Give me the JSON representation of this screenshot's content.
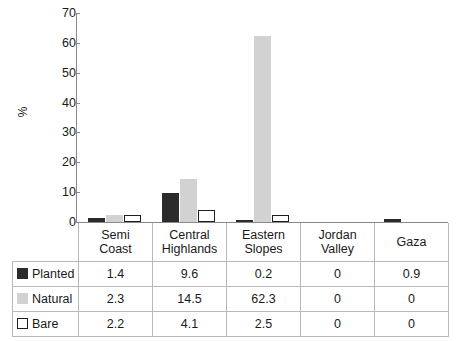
{
  "chart_data": {
    "type": "bar",
    "title": "",
    "subtitle": "",
    "xlabel": "",
    "ylabel": "%",
    "ylim": [
      0,
      70
    ],
    "yticks": [
      0,
      10,
      20,
      30,
      40,
      50,
      60,
      70
    ],
    "grid": false,
    "legend_position": "table-row-labels",
    "categories": [
      "Semi Coast",
      "Central Highlands",
      "Eastern Slopes",
      "Jordan Valley",
      "Gaza"
    ],
    "category_lines": [
      [
        "Semi",
        "Coast"
      ],
      [
        "Central",
        "Highlands"
      ],
      [
        "Eastern",
        "Slopes"
      ],
      [
        "Jordan",
        "Valley"
      ],
      [
        "Gaza",
        ""
      ]
    ],
    "series": [
      {
        "name": "Planted",
        "color": "#2b2b2b",
        "swatch": "planted",
        "values": [
          1.4,
          9.6,
          0.2,
          0,
          0.9
        ],
        "labels": [
          "1.4",
          "9.6",
          "0.2",
          "0",
          "0.9"
        ]
      },
      {
        "name": "Natural",
        "color": "#d2d2d2",
        "swatch": "natural",
        "values": [
          2.3,
          14.5,
          62.3,
          0,
          0
        ],
        "labels": [
          "2.3",
          "14.5",
          "62.3",
          "0",
          "0"
        ]
      },
      {
        "name": "Bare",
        "color": "#ffffff",
        "swatch": "bare",
        "values": [
          2.2,
          4.1,
          2.5,
          0,
          0
        ],
        "labels": [
          "2.2",
          "4.1",
          "2.5",
          "0",
          "0"
        ]
      }
    ]
  },
  "axis": {
    "y_label": "%",
    "tick_labels": [
      "70",
      "60",
      "50",
      "40",
      "30",
      "20",
      "10",
      "0"
    ]
  },
  "table": {
    "headers": [
      "Semi Coast",
      "Central Highlands",
      "Eastern Slopes",
      "Jordan Valley",
      "Gaza"
    ],
    "rows": [
      {
        "label": "Planted",
        "values": [
          "1.4",
          "9.6",
          "0.2",
          "0",
          "0.9"
        ]
      },
      {
        "label": "Natural",
        "values": [
          "2.3",
          "14.5",
          "62.3",
          "0",
          "0"
        ]
      },
      {
        "label": "Bare",
        "values": [
          "2.2",
          "4.1",
          "2.5",
          "0",
          "0"
        ]
      }
    ]
  },
  "colors": {
    "planted": "#2b2b2b",
    "natural": "#d2d2d2",
    "bare": "#ffffff",
    "axis": "#8a8a8a",
    "grid_border": "#b9b9b9",
    "text": "#1a1a1a"
  }
}
